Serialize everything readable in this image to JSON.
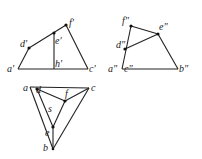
{
  "diagram": {
    "front_view": {
      "labels": {
        "a": "a'",
        "b": "h'",
        "c": "c'",
        "d": "d'",
        "e": "e'",
        "f": "f'"
      }
    },
    "side_view": {
      "labels": {
        "a": "a\"",
        "c": "c\"",
        "b": "b\"",
        "d": "d\"",
        "e": "e\"",
        "f": "f\""
      }
    },
    "top_view": {
      "labels": {
        "a": "a",
        "c": "c",
        "d": "d",
        "f": "f",
        "s": "s",
        "e": "e",
        "b": "b"
      }
    }
  }
}
